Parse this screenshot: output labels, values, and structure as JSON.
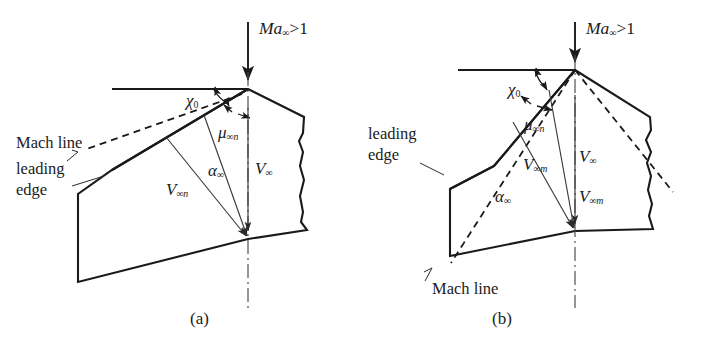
{
  "figure": {
    "panels": [
      {
        "id": "a",
        "caption": "(a)",
        "description": "Subsonic normal component: Mach line ahead of leading edge",
        "labels": {
          "mach_number": "Ma",
          "mach_number_sub": "∞",
          "mach_number_rel": ">1",
          "sweep_angle": "χ",
          "sweep_angle_sub": "0",
          "mach_angle": "μ",
          "mach_angle_sub": "∞n",
          "aoa": "α",
          "aoa_sub": "∞",
          "v_normal": "V",
          "v_normal_sub": "∞n",
          "v_free": "V",
          "v_free_sub": "∞",
          "mach_line": "Mach line",
          "leading_edge_line1": "leading",
          "leading_edge_line2": "edge"
        }
      },
      {
        "id": "b",
        "caption": "(b)",
        "description": "Supersonic normal component: Mach line behind leading edge",
        "labels": {
          "mach_number": "Ma",
          "mach_number_sub": "∞",
          "mach_number_rel": ">1",
          "sweep_angle": "χ",
          "sweep_angle_sub": "0",
          "mach_angle": "μ",
          "mach_angle_sub": "∞n",
          "aoa": "α",
          "aoa_sub": "∞",
          "v_m_left": "V",
          "v_m_left_sub": "∞m",
          "v_free": "V",
          "v_free_sub": "∞",
          "v_m_right": "V",
          "v_m_right_sub": "∞m",
          "mach_line": "Mach line",
          "leading_edge_line1": "leading",
          "leading_edge_line2": "edge"
        }
      }
    ],
    "colors": {
      "line": "#1a1a1a",
      "thin_line": "#3a3a3a",
      "centerline": "#4a4a4a",
      "background": "#ffffff",
      "text": "#1b1b1b"
    }
  }
}
